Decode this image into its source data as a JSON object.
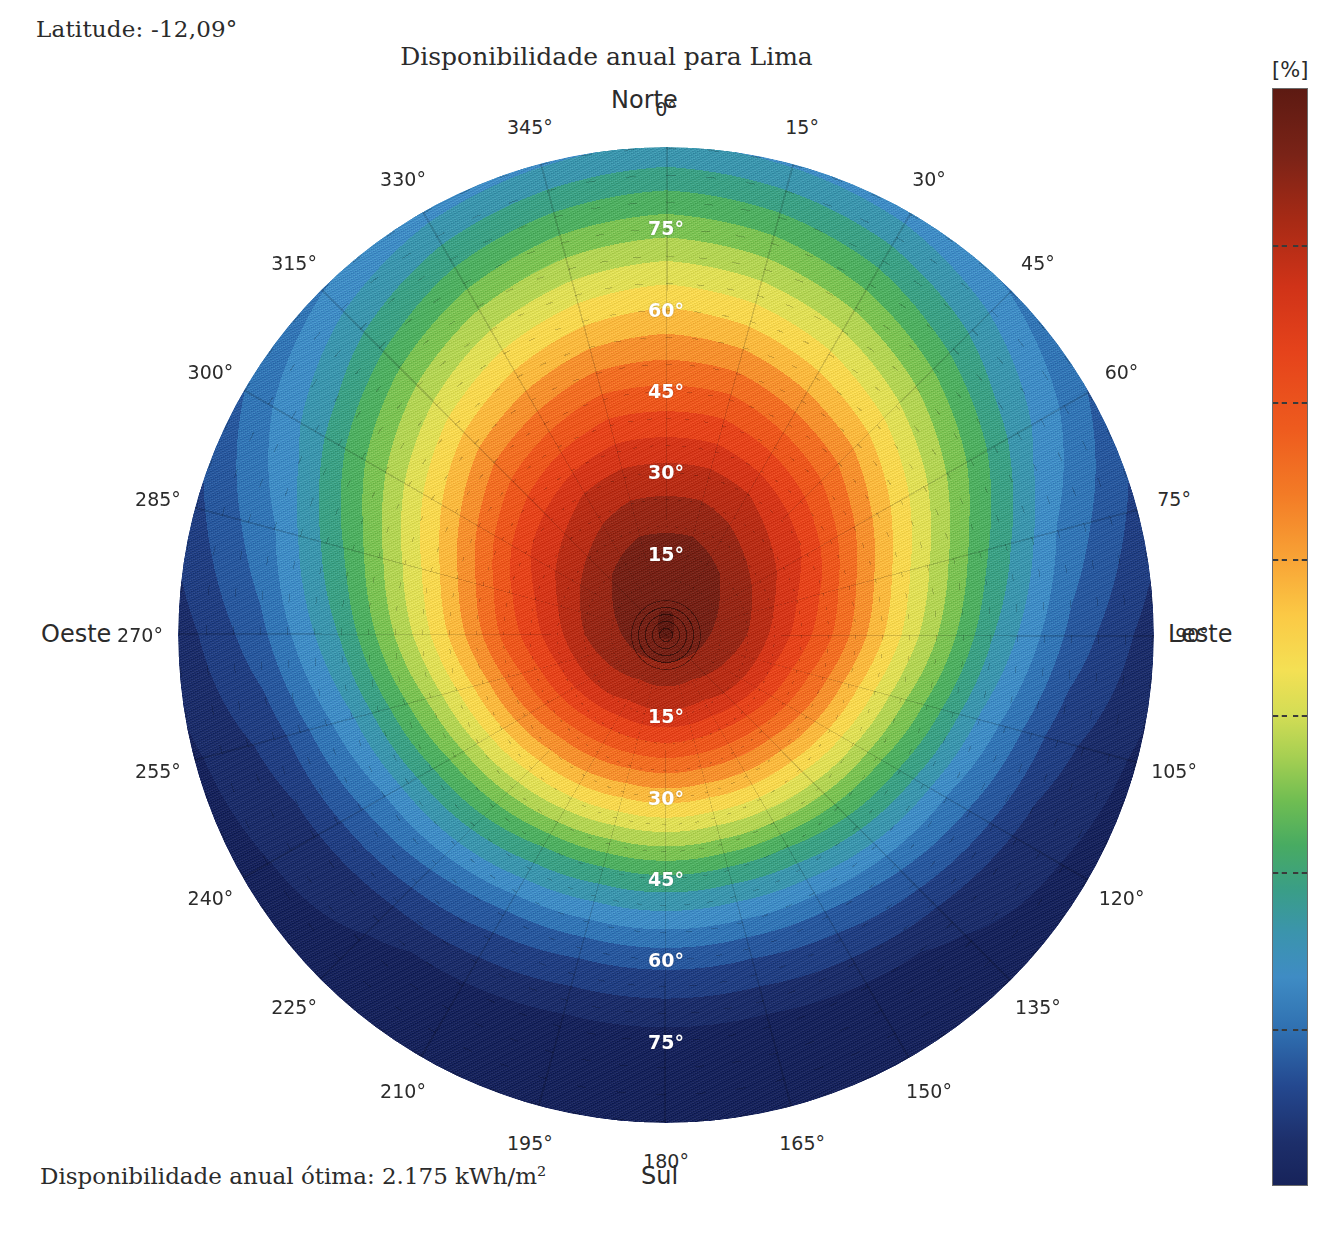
{
  "header": {
    "latitude_label": "Latitude: -12,09°",
    "title": "Disponibilidade anual para Lima",
    "optimal_label": "Disponibilidade anual ótima: 2.175 kWh/m²"
  },
  "cardinals": {
    "north": "Norte",
    "south": "Sul",
    "west": "Oeste",
    "east": "Leste"
  },
  "colorbar": {
    "unit": "[%]",
    "ticks": [
      100,
      90,
      80,
      70,
      60,
      50,
      40,
      30
    ],
    "min": 30,
    "max": 100
  },
  "azimuth_labels": [
    "0°",
    "15°",
    "30°",
    "45°",
    "60°",
    "75°",
    "90°",
    "105°",
    "120°",
    "135°",
    "150°",
    "165°",
    "180°",
    "195°",
    "210°",
    "225°",
    "240°",
    "255°",
    "270°",
    "285°",
    "300°",
    "315°",
    "330°",
    "345°"
  ],
  "elevation_labels_north": [
    "75°",
    "60°",
    "45°",
    "30°",
    "15°"
  ],
  "elevation_labels_south": [
    "15°",
    "30°",
    "45°",
    "60°",
    "75°"
  ],
  "chart_data": {
    "type": "heatmap",
    "projection": "polar",
    "title": "Disponibilidade anual para Lima",
    "subtitle": "Disponibilidade anual ótima: 2.175 kWh/m²",
    "latitude": -12.09,
    "location": "Lima",
    "optimal_annual_availability_kwh_m2": 2175,
    "unit": "[%]",
    "zlim": [
      30,
      100
    ],
    "zlabel": "Disponibilidade anual [%]",
    "theta_label": "Azimute",
    "theta_unit": "degrees",
    "theta_ticks": [
      0,
      15,
      30,
      45,
      60,
      75,
      90,
      105,
      120,
      135,
      150,
      165,
      180,
      195,
      210,
      225,
      240,
      255,
      270,
      285,
      300,
      315,
      330,
      345
    ],
    "theta_tick_labels": [
      "0°",
      "15°",
      "30°",
      "45°",
      "60°",
      "75°",
      "90°",
      "105°",
      "120°",
      "135°",
      "150°",
      "165°",
      "180°",
      "195°",
      "210°",
      "225°",
      "240°",
      "255°",
      "270°",
      "285°",
      "300°",
      "315°",
      "330°",
      "345°"
    ],
    "theta_direction": "clockwise",
    "theta_zero_location": "N",
    "r_label": "Inclinação",
    "r_unit": "degrees",
    "r_ticks": [
      0,
      15,
      30,
      45,
      60,
      75,
      90
    ],
    "r_tick_labels": [
      "0°",
      "15°",
      "30°",
      "45°",
      "60°",
      "75°",
      "90°"
    ],
    "rlim": [
      0,
      90
    ],
    "grid": true,
    "legend": "colorbar-right",
    "colormap": "spectral-jet",
    "colormap_stops": [
      {
        "value": 100,
        "color": "#5d1a12"
      },
      {
        "value": 96,
        "color": "#7a2317"
      },
      {
        "value": 92,
        "color": "#a72a15"
      },
      {
        "value": 88,
        "color": "#d03318"
      },
      {
        "value": 84,
        "color": "#e5431b"
      },
      {
        "value": 80,
        "color": "#ee5b1e"
      },
      {
        "value": 76,
        "color": "#f37b26"
      },
      {
        "value": 73,
        "color": "#f8a436"
      },
      {
        "value": 70,
        "color": "#fbc945"
      },
      {
        "value": 67,
        "color": "#f4e054"
      },
      {
        "value": 64,
        "color": "#d4dd55"
      },
      {
        "value": 61,
        "color": "#a5cf52"
      },
      {
        "value": 58,
        "color": "#6fbd52"
      },
      {
        "value": 55,
        "color": "#48ab62"
      },
      {
        "value": 52,
        "color": "#3a9e86"
      },
      {
        "value": 49,
        "color": "#3b94ad"
      },
      {
        "value": 46,
        "color": "#3f8cc4"
      },
      {
        "value": 42,
        "color": "#2f6fb0"
      },
      {
        "value": 38,
        "color": "#24488f"
      },
      {
        "value": 34,
        "color": "#1d2f6b"
      },
      {
        "value": 30,
        "color": "#17235a"
      }
    ],
    "radial_profiles": [
      {
        "azimuth": 0,
        "tilt": [
          0,
          15,
          30,
          45,
          60,
          75,
          90
        ],
        "values": [
          99,
          97,
          90,
          80,
          70,
          59,
          48
        ]
      },
      {
        "azimuth": 15,
        "tilt": [
          0,
          15,
          30,
          45,
          60,
          75,
          90
        ],
        "values": [
          99,
          97,
          90,
          80,
          69,
          58,
          47
        ]
      },
      {
        "azimuth": 30,
        "tilt": [
          0,
          15,
          30,
          45,
          60,
          75,
          90
        ],
        "values": [
          99,
          96,
          89,
          78,
          67,
          56,
          46
        ]
      },
      {
        "azimuth": 45,
        "tilt": [
          0,
          15,
          30,
          45,
          60,
          75,
          90
        ],
        "values": [
          99,
          95,
          87,
          76,
          64,
          53,
          44
        ]
      },
      {
        "azimuth": 60,
        "tilt": [
          0,
          15,
          30,
          45,
          60,
          75,
          90
        ],
        "values": [
          99,
          94,
          85,
          72,
          60,
          49,
          41
        ]
      },
      {
        "azimuth": 75,
        "tilt": [
          0,
          15,
          30,
          45,
          60,
          75,
          90
        ],
        "values": [
          99,
          93,
          82,
          68,
          55,
          44,
          37
        ]
      },
      {
        "azimuth": 90,
        "tilt": [
          0,
          15,
          30,
          45,
          60,
          75,
          90
        ],
        "values": [
          99,
          92,
          80,
          65,
          51,
          40,
          33
        ]
      },
      {
        "azimuth": 105,
        "tilt": [
          0,
          15,
          30,
          45,
          60,
          75,
          90
        ],
        "values": [
          99,
          91,
          77,
          61,
          47,
          36,
          31
        ]
      },
      {
        "azimuth": 120,
        "tilt": [
          0,
          15,
          30,
          45,
          60,
          75,
          90
        ],
        "values": [
          99,
          90,
          75,
          58,
          44,
          34,
          30
        ]
      },
      {
        "azimuth": 135,
        "tilt": [
          0,
          15,
          30,
          45,
          60,
          75,
          90
        ],
        "values": [
          99,
          89,
          73,
          56,
          42,
          32,
          30
        ]
      },
      {
        "azimuth": 150,
        "tilt": [
          0,
          15,
          30,
          45,
          60,
          75,
          90
        ],
        "values": [
          99,
          88,
          72,
          54,
          40,
          31,
          30
        ]
      },
      {
        "azimuth": 165,
        "tilt": [
          0,
          15,
          30,
          45,
          60,
          75,
          90
        ],
        "values": [
          99,
          88,
          71,
          53,
          39,
          30,
          30
        ]
      },
      {
        "azimuth": 180,
        "tilt": [
          0,
          15,
          30,
          45,
          60,
          75,
          90
        ],
        "values": [
          99,
          88,
          71,
          53,
          39,
          30,
          30
        ]
      },
      {
        "azimuth": 195,
        "tilt": [
          0,
          15,
          30,
          45,
          60,
          75,
          90
        ],
        "values": [
          99,
          88,
          71,
          53,
          39,
          30,
          30
        ]
      },
      {
        "azimuth": 210,
        "tilt": [
          0,
          15,
          30,
          45,
          60,
          75,
          90
        ],
        "values": [
          99,
          88,
          72,
          54,
          40,
          31,
          30
        ]
      },
      {
        "azimuth": 225,
        "tilt": [
          0,
          15,
          30,
          45,
          60,
          75,
          90
        ],
        "values": [
          99,
          89,
          73,
          56,
          42,
          32,
          30
        ]
      },
      {
        "azimuth": 240,
        "tilt": [
          0,
          15,
          30,
          45,
          60,
          75,
          90
        ],
        "values": [
          99,
          90,
          75,
          58,
          44,
          34,
          30
        ]
      },
      {
        "azimuth": 255,
        "tilt": [
          0,
          15,
          30,
          45,
          60,
          75,
          90
        ],
        "values": [
          99,
          91,
          77,
          61,
          47,
          36,
          31
        ]
      },
      {
        "azimuth": 270,
        "tilt": [
          0,
          15,
          30,
          45,
          60,
          75,
          90
        ],
        "values": [
          99,
          92,
          80,
          65,
          51,
          40,
          33
        ]
      },
      {
        "azimuth": 285,
        "tilt": [
          0,
          15,
          30,
          45,
          60,
          75,
          90
        ],
        "values": [
          99,
          93,
          82,
          68,
          55,
          44,
          37
        ]
      },
      {
        "azimuth": 300,
        "tilt": [
          0,
          15,
          30,
          45,
          60,
          75,
          90
        ],
        "values": [
          99,
          94,
          85,
          72,
          60,
          49,
          41
        ]
      },
      {
        "azimuth": 315,
        "tilt": [
          0,
          15,
          30,
          45,
          60,
          75,
          90
        ],
        "values": [
          99,
          95,
          87,
          76,
          64,
          53,
          44
        ]
      },
      {
        "azimuth": 330,
        "tilt": [
          0,
          15,
          30,
          45,
          60,
          75,
          90
        ],
        "values": [
          99,
          96,
          89,
          78,
          67,
          56,
          46
        ]
      },
      {
        "azimuth": 345,
        "tilt": [
          0,
          15,
          30,
          45,
          60,
          75,
          90
        ],
        "values": [
          99,
          97,
          90,
          80,
          69,
          58,
          47
        ]
      }
    ]
  }
}
